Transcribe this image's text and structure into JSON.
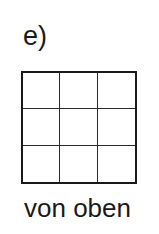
{
  "figure": {
    "label": "e)",
    "caption": "von oben",
    "grid": {
      "rows": 3,
      "columns": 3,
      "line_color": "#1a1a1a",
      "description": "top view of a 3x3 square grid"
    }
  }
}
